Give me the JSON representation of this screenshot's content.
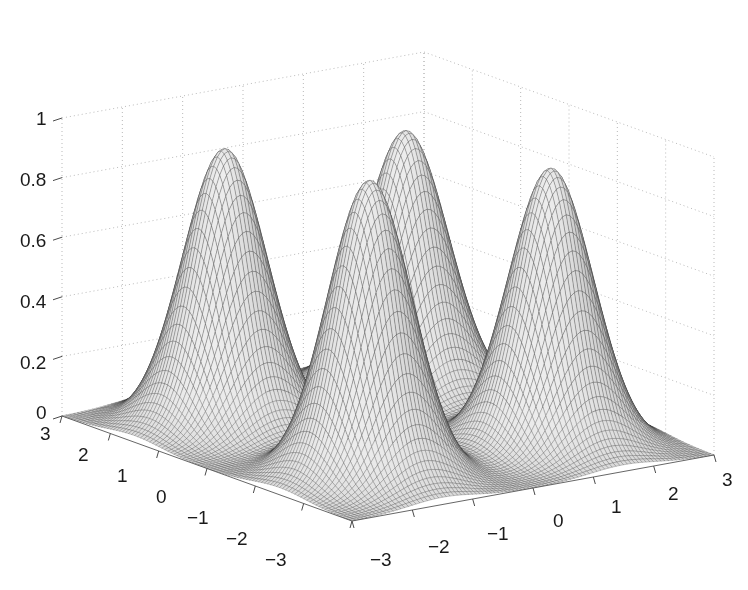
{
  "figure": {
    "background_color": "#ffffff",
    "type": "matlab-3d-mesh-surface",
    "width": 748,
    "height": 590
  },
  "chart_data": {
    "type": "surface",
    "title": "",
    "xlabel": "",
    "ylabel": "",
    "zlabel": "",
    "projection": "3d-mesh",
    "view": {
      "azimuth": -37.5,
      "elevation": 30
    },
    "grid": true,
    "grid_style": "dotted",
    "grid_color": "#b9b9b9",
    "mesh_color": "#4a4a4a",
    "surface_shading": "grayscale",
    "xlim": [
      -3,
      3
    ],
    "ylim": [
      -3,
      3
    ],
    "zlim": [
      0,
      1
    ],
    "x_ticks": [
      -3,
      -2,
      -1,
      0,
      1,
      2,
      3
    ],
    "x_tick_labels": [
      "-3",
      "-2",
      "-1",
      "0",
      "1",
      "2",
      "3"
    ],
    "y_ticks": [
      -3,
      -2,
      -1,
      0,
      1,
      2,
      3
    ],
    "y_tick_labels": [
      "3",
      "2",
      "1",
      "0",
      "-1",
      "-2",
      "-3"
    ],
    "z_ticks": [
      0,
      0.2,
      0.4,
      0.6,
      0.8,
      1
    ],
    "z_tick_labels": [
      "0",
      "0.2",
      "0.4",
      "0.6",
      "0.8",
      "1"
    ],
    "peaks": [
      {
        "name": "peak-back-center",
        "x": -1.5,
        "y": -1.5,
        "height": 1.0,
        "sigma": 0.55
      },
      {
        "name": "peak-left-front",
        "x": -1.5,
        "y": 1.5,
        "height": 0.93,
        "sigma": 0.55
      },
      {
        "name": "peak-right-front",
        "x": 1.5,
        "y": -1.5,
        "height": 0.93,
        "sigma": 0.55
      },
      {
        "name": "peak-center-mid",
        "x": 1.5,
        "y": 1.5,
        "height": 0.88,
        "sigma": 0.55
      }
    ],
    "z_tick_values_rendered": [
      "1",
      "0.8",
      "0.6",
      "0.4",
      "0.2",
      "0"
    ],
    "x_axis_tick_values_rendered": [
      "-3",
      "-2",
      "-1",
      "0",
      "1",
      "2",
      "3"
    ],
    "y_axis_tick_values_rendered": [
      "3",
      "2",
      "1",
      "0",
      "-1",
      "-2",
      "-3"
    ]
  },
  "axis_labels": {
    "z": [
      {
        "text": "1",
        "x": 36,
        "y": 109
      },
      {
        "text": "0.8",
        "x": 20,
        "y": 170
      },
      {
        "text": "0.6",
        "x": 20,
        "y": 231
      },
      {
        "text": "0.4",
        "x": 20,
        "y": 292
      },
      {
        "text": "0.2",
        "x": 20,
        "y": 353
      },
      {
        "text": "0",
        "x": 36,
        "y": 403
      }
    ],
    "y": [
      {
        "text": "3",
        "x": 40,
        "y": 424
      },
      {
        "text": "2",
        "x": 78,
        "y": 445
      },
      {
        "text": "1",
        "x": 117,
        "y": 466
      },
      {
        "text": "0",
        "x": 156,
        "y": 487
      },
      {
        "text": "-1",
        "x": 187,
        "y": 508
      },
      {
        "text": "-2",
        "x": 226,
        "y": 529
      },
      {
        "text": "-3",
        "x": 265,
        "y": 550
      }
    ],
    "x": [
      {
        "text": "-3",
        "x": 370,
        "y": 550
      },
      {
        "text": "-2",
        "x": 428,
        "y": 537
      },
      {
        "text": "-1",
        "x": 487,
        "y": 524
      },
      {
        "text": "0",
        "x": 553,
        "y": 511
      },
      {
        "text": "1",
        "x": 611,
        "y": 497
      },
      {
        "text": "2",
        "x": 668,
        "y": 484
      },
      {
        "text": "3",
        "x": 722,
        "y": 470
      }
    ]
  }
}
